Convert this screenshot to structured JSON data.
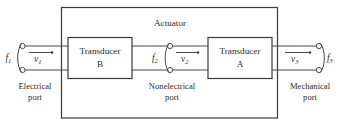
{
  "figure": {
    "title": "Actuator",
    "blocks": [
      {
        "id": "transducer-b",
        "line1": "Transducer",
        "line2": "B"
      },
      {
        "id": "transducer-a",
        "line1": "Transducer",
        "line2": "A"
      }
    ],
    "ports": [
      {
        "id": "electrical-port",
        "label_line1": "Electrical",
        "label_line2": "port",
        "force_symbol": "f",
        "force_subscript": "1",
        "velocity_symbol": "v",
        "velocity_subscript": "1"
      },
      {
        "id": "nonelectrical-port",
        "label_line1": "Nonelectrical",
        "label_line2": "port",
        "force_symbol": "f",
        "force_subscript": "2",
        "velocity_symbol": "v",
        "velocity_subscript": "2"
      },
      {
        "id": "mechanical-port",
        "label_line1": "Mechanical",
        "label_line2": "port",
        "force_symbol": "f",
        "force_subscript": "3",
        "velocity_symbol": "v",
        "velocity_subscript": "3"
      }
    ],
    "colors": {
      "stroke": "#4a4a4a",
      "box_stroke": "#3a3a3a",
      "text": "#2b2b2b",
      "background": "#ffffff"
    }
  }
}
